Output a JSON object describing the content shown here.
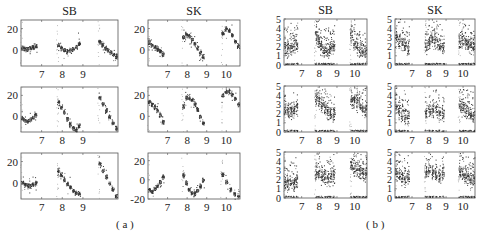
{
  "figure": {
    "captions": {
      "a": "( a )",
      "b": "( b )"
    },
    "column_titles": [
      "SB",
      "SK"
    ]
  },
  "chart_data": [
    {
      "panel": "a",
      "type": "scatter",
      "title": "SB",
      "row": 1,
      "xticks": [
        "7",
        "8",
        "9"
      ],
      "yticks": [
        "0",
        "20"
      ],
      "ylim": [
        -15,
        28
      ],
      "groups": [
        {
          "xstart": 6.05,
          "xend": 6.7,
          "centers": [
            2,
            1,
            1,
            2,
            3,
            4
          ]
        },
        {
          "xstart": 7.8,
          "xend": 8.8,
          "centers": [
            5,
            2,
            0,
            -1,
            0,
            1,
            3,
            6
          ]
        },
        {
          "xstart": 9.8,
          "xend": 10.6,
          "centers": [
            8,
            5,
            2,
            0,
            -2,
            -4,
            -6
          ]
        }
      ]
    },
    {
      "panel": "a",
      "type": "scatter",
      "title": "SK",
      "row": 1,
      "xticks": [
        "7",
        "8",
        "9",
        "10"
      ],
      "yticks": [
        "0",
        "20"
      ],
      "ylim": [
        -15,
        28
      ],
      "groups": [
        {
          "xstart": 6.05,
          "xend": 6.75,
          "centers": [
            7,
            5,
            3,
            1,
            -1,
            -4
          ]
        },
        {
          "xstart": 7.8,
          "xend": 8.8,
          "centers": [
            12,
            15,
            13,
            10,
            6,
            2,
            -2,
            -6
          ]
        },
        {
          "xstart": 9.8,
          "xend": 10.6,
          "centers": [
            16,
            20,
            18,
            14,
            8,
            4
          ]
        }
      ]
    },
    {
      "panel": "a",
      "type": "scatter",
      "title": "SB",
      "row": 2,
      "xticks": [
        "7",
        "8",
        "9"
      ],
      "yticks": [
        "0",
        "20"
      ],
      "ylim": [
        -15,
        28
      ],
      "groups": [
        {
          "xstart": 6.05,
          "xend": 6.7,
          "centers": [
            -2,
            -4,
            -4,
            -3,
            -1,
            1
          ]
        },
        {
          "xstart": 7.8,
          "xend": 8.8,
          "centers": [
            14,
            9,
            4,
            -2,
            -7,
            -11,
            -13,
            -9
          ]
        },
        {
          "xstart": 9.8,
          "xend": 10.6,
          "centers": [
            18,
            12,
            6,
            0,
            -6,
            -11
          ]
        }
      ]
    },
    {
      "panel": "a",
      "type": "scatter",
      "title": "SK",
      "row": 2,
      "xticks": [
        "7",
        "8",
        "9",
        "10"
      ],
      "yticks": [
        "0",
        "20"
      ],
      "ylim": [
        -15,
        28
      ],
      "groups": [
        {
          "xstart": 6.05,
          "xend": 6.75,
          "centers": [
            14,
            12,
            9,
            6,
            1,
            -5
          ]
        },
        {
          "xstart": 7.8,
          "xend": 8.8,
          "centers": [
            10,
            18,
            18,
            16,
            12,
            7,
            0,
            -6
          ]
        },
        {
          "xstart": 9.8,
          "xend": 10.6,
          "centers": [
            20,
            24,
            24,
            21,
            17,
            12
          ]
        }
      ]
    },
    {
      "panel": "a",
      "type": "scatter",
      "title": "SB",
      "row": 3,
      "xticks": [
        "7",
        "8",
        "9"
      ],
      "yticks": [
        "0",
        "20"
      ],
      "ylim": [
        -15,
        28
      ],
      "groups": [
        {
          "xstart": 6.05,
          "xend": 6.7,
          "centers": [
            1,
            -1,
            -2,
            -2,
            -1,
            0
          ]
        },
        {
          "xstart": 7.8,
          "xend": 8.8,
          "centers": [
            12,
            8,
            3,
            -1,
            -4,
            -7,
            -9,
            -10
          ]
        },
        {
          "xstart": 9.8,
          "xend": 10.6,
          "centers": [
            18,
            12,
            6,
            0,
            -6,
            -12
          ]
        }
      ]
    },
    {
      "panel": "a",
      "type": "scatter",
      "title": "SK",
      "row": 3,
      "xticks": [
        "7",
        "8",
        "9",
        "10"
      ],
      "yticks": [
        "-20",
        "0",
        "20"
      ],
      "ylim": [
        -20,
        28
      ],
      "groups": [
        {
          "xstart": 6.05,
          "xend": 6.75,
          "centers": [
            -10,
            -12,
            -9,
            -6,
            -2,
            3
          ]
        },
        {
          "xstart": 7.8,
          "xend": 8.8,
          "centers": [
            5,
            -3,
            -10,
            -13,
            -14,
            -11,
            -6,
            0
          ]
        },
        {
          "xstart": 9.8,
          "xend": 10.6,
          "centers": [
            6,
            -2,
            -10,
            -15,
            -17
          ]
        }
      ]
    },
    {
      "panel": "b",
      "type": "scatter",
      "title": "SB",
      "row": 1,
      "xticks": [
        "7",
        "8",
        "9",
        "10"
      ],
      "yticks": [
        "0",
        "1",
        "2",
        "3",
        "4",
        "5"
      ],
      "ylim": [
        0,
        5
      ],
      "groups": [
        {
          "xstart": 6.05,
          "xend": 6.7,
          "centers": [
            1.8,
            1.8,
            1.8,
            2.0,
            2.2
          ]
        },
        {
          "xstart": 7.8,
          "xend": 8.8,
          "centers": [
            3.2,
            2.6,
            2.0,
            1.6,
            1.6,
            1.8,
            2.0,
            2.2
          ]
        },
        {
          "xstart": 9.8,
          "xend": 10.6,
          "centers": [
            3.2,
            2.4,
            2.0,
            1.8,
            1.6,
            1.4
          ]
        }
      ]
    },
    {
      "panel": "b",
      "type": "scatter",
      "title": "SK",
      "row": 1,
      "xticks": [
        "7",
        "8",
        "9",
        "10"
      ],
      "yticks": [
        "0",
        "1",
        "2",
        "3",
        "4",
        "5"
      ],
      "ylim": [
        0,
        5
      ],
      "groups": [
        {
          "xstart": 6.05,
          "xend": 6.75,
          "centers": [
            3.0,
            2.6,
            2.4,
            2.2,
            2.0
          ]
        },
        {
          "xstart": 7.8,
          "xend": 8.8,
          "centers": [
            2.0,
            2.4,
            2.8,
            2.6,
            2.4,
            2.2,
            2.0
          ]
        },
        {
          "xstart": 9.8,
          "xend": 10.6,
          "centers": [
            2.6,
            2.8,
            2.6,
            2.4,
            2.2,
            2.0
          ]
        }
      ]
    },
    {
      "panel": "b",
      "type": "scatter",
      "title": "SB",
      "row": 2,
      "xticks": [
        "7",
        "8",
        "9",
        "10"
      ],
      "yticks": [
        "0",
        "1",
        "2",
        "3",
        "4",
        "5"
      ],
      "ylim": [
        0,
        5
      ],
      "groups": [
        {
          "xstart": 6.05,
          "xend": 6.7,
          "centers": [
            2.4,
            2.2,
            2.2,
            2.4,
            2.6
          ]
        },
        {
          "xstart": 7.8,
          "xend": 8.8,
          "centers": [
            3.8,
            3.4,
            3.0,
            2.6,
            2.2,
            2.0,
            2.0
          ]
        },
        {
          "xstart": 9.8,
          "xend": 10.6,
          "centers": [
            3.6,
            3.4,
            3.2,
            3.0,
            2.8,
            2.4
          ]
        }
      ]
    },
    {
      "panel": "b",
      "type": "scatter",
      "title": "SK",
      "row": 2,
      "xticks": [
        "7",
        "8",
        "9",
        "10"
      ],
      "yticks": [
        "0",
        "1",
        "2",
        "3",
        "4",
        "5"
      ],
      "ylim": [
        0,
        5
      ],
      "groups": [
        {
          "xstart": 6.05,
          "xend": 6.75,
          "centers": [
            2.8,
            2.4,
            2.0,
            1.8,
            1.6
          ]
        },
        {
          "xstart": 7.8,
          "xend": 8.8,
          "centers": [
            2.0,
            2.2,
            2.4,
            2.4,
            2.2,
            2.0
          ]
        },
        {
          "xstart": 9.8,
          "xend": 10.6,
          "centers": [
            3.0,
            2.6,
            2.4,
            2.2,
            2.0,
            1.8
          ]
        }
      ]
    },
    {
      "panel": "b",
      "type": "scatter",
      "title": "SB",
      "row": 3,
      "xticks": [
        "7",
        "8",
        "9",
        "10"
      ],
      "yticks": [
        "0",
        "1",
        "2",
        "3",
        "4",
        "5"
      ],
      "ylim": [
        0,
        5
      ],
      "groups": [
        {
          "xstart": 6.05,
          "xend": 6.7,
          "centers": [
            1.6,
            1.6,
            1.6,
            1.6,
            1.8
          ]
        },
        {
          "xstart": 7.8,
          "xend": 8.8,
          "centers": [
            2.8,
            2.6,
            2.4,
            2.2,
            2.0,
            2.2,
            2.4
          ]
        },
        {
          "xstart": 9.8,
          "xend": 10.6,
          "centers": [
            3.6,
            3.2,
            3.0,
            3.0,
            2.8,
            2.6
          ]
        }
      ]
    },
    {
      "panel": "b",
      "type": "scatter",
      "title": "SK",
      "row": 3,
      "xticks": [
        "7",
        "8",
        "9",
        "10"
      ],
      "yticks": [
        "0",
        "1",
        "2",
        "3",
        "4",
        "5"
      ],
      "ylim": [
        0,
        5
      ],
      "groups": [
        {
          "xstart": 6.05,
          "xend": 6.75,
          "centers": [
            2.6,
            2.4,
            2.2,
            2.2,
            2.4
          ]
        },
        {
          "xstart": 7.8,
          "xend": 8.8,
          "centers": [
            2.8,
            3.0,
            2.8,
            2.6,
            2.4,
            2.6
          ]
        },
        {
          "xstart": 9.8,
          "xend": 10.6,
          "centers": [
            2.8,
            2.6,
            2.4,
            2.2,
            2.0,
            2.2
          ]
        }
      ]
    }
  ],
  "layout": {
    "frames": [
      {
        "x": 21,
        "y": 20,
        "w": 97,
        "h": 46
      },
      {
        "x": 148,
        "y": 20,
        "w": 92,
        "h": 46
      },
      {
        "x": 21,
        "y": 87,
        "w": 97,
        "h": 45
      },
      {
        "x": 148,
        "y": 87,
        "w": 92,
        "h": 45
      },
      {
        "x": 21,
        "y": 153,
        "w": 97,
        "h": 46
      },
      {
        "x": 148,
        "y": 153,
        "w": 92,
        "h": 46
      },
      {
        "x": 284,
        "y": 19,
        "w": 83,
        "h": 46
      },
      {
        "x": 395,
        "y": 19,
        "w": 80,
        "h": 46
      },
      {
        "x": 284,
        "y": 86,
        "w": 83,
        "h": 46
      },
      {
        "x": 395,
        "y": 86,
        "w": 80,
        "h": 46
      },
      {
        "x": 284,
        "y": 152,
        "w": 83,
        "h": 46
      },
      {
        "x": 395,
        "y": 152,
        "w": 80,
        "h": 46
      }
    ],
    "xlim": [
      6.0,
      10.7
    ]
  }
}
